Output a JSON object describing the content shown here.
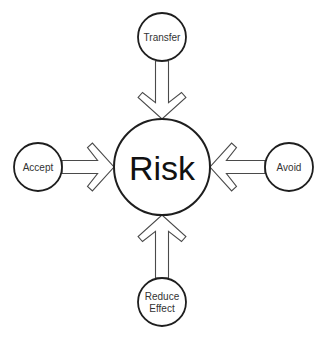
{
  "diagram": {
    "type": "radial-inflow",
    "center": {
      "id": "risk",
      "label": "Risk"
    },
    "nodes": [
      {
        "id": "transfer",
        "label": [
          "Transfer"
        ],
        "position": "top"
      },
      {
        "id": "accept",
        "label": [
          "Accept"
        ],
        "position": "left"
      },
      {
        "id": "avoid",
        "label": [
          "Avoid"
        ],
        "position": "right"
      },
      {
        "id": "reduce-effect",
        "label": [
          "Reduce",
          "Effect"
        ],
        "position": "bottom"
      }
    ],
    "edges": [
      {
        "from": "transfer",
        "to": "risk",
        "style": "hollow-open-arrow"
      },
      {
        "from": "accept",
        "to": "risk",
        "style": "hollow-open-arrow"
      },
      {
        "from": "avoid",
        "to": "risk",
        "style": "hollow-open-arrow"
      },
      {
        "from": "reduce-effect",
        "to": "risk",
        "style": "hollow-open-arrow"
      }
    ],
    "colors": {
      "circle_stroke": "#1e1e1e",
      "arrow_stroke": "#4a4a4a",
      "text": "#333333",
      "background": "#ffffff"
    }
  }
}
